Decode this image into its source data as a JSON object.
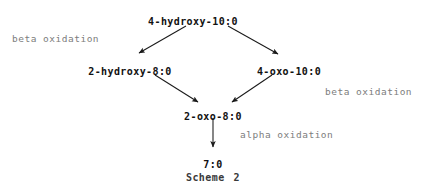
{
  "scheme": {
    "caption_label": "Scheme",
    "caption_number": "2",
    "nodes": [
      {
        "id": "n1",
        "label": "4-hydroxy-10:0",
        "x": 193,
        "y": 16
      },
      {
        "id": "n2",
        "label": "2-hydroxy-8:0",
        "x": 130,
        "y": 66
      },
      {
        "id": "n3",
        "label": "4-oxo-10:0",
        "x": 289,
        "y": 66
      },
      {
        "id": "n4",
        "label": "2-oxo-8:0",
        "x": 213,
        "y": 111
      },
      {
        "id": "n5",
        "label": "7:0",
        "x": 213,
        "y": 159
      }
    ],
    "annotations": [
      {
        "id": "a1",
        "text": "beta oxidation",
        "x": 12,
        "y": 33
      },
      {
        "id": "a2",
        "text": "beta oxidation",
        "x": 325,
        "y": 86
      },
      {
        "id": "a3",
        "text": "alpha oxidation",
        "x": 240,
        "y": 129
      }
    ],
    "edges": [
      {
        "id": "e1",
        "from": "4-hydroxy-10:0",
        "to": "2-hydroxy-8:0",
        "x1": 186,
        "y1": 26,
        "x2": 139,
        "y2": 53
      },
      {
        "id": "e2",
        "from": "4-hydroxy-10:0",
        "to": "4-oxo-10:0",
        "x1": 228,
        "y1": 26,
        "x2": 278,
        "y2": 54
      },
      {
        "id": "e3",
        "from": "2-hydroxy-8:0",
        "to": "2-oxo-8:0",
        "x1": 155,
        "y1": 75,
        "x2": 198,
        "y2": 102
      },
      {
        "id": "e4",
        "from": "4-oxo-10:0",
        "to": "2-oxo-8:0",
        "x1": 272,
        "y1": 75,
        "x2": 232,
        "y2": 102
      },
      {
        "id": "e5",
        "from": "2-oxo-8:0",
        "to": "7:0",
        "x1": 213,
        "y1": 118,
        "x2": 213,
        "y2": 147
      }
    ],
    "caption_x": 213,
    "caption_y": 172,
    "colors": {
      "node_text": "#111111",
      "annotation_text": "#7d7d7d",
      "arrow": "#1a1a1a",
      "background": "#ffffff"
    }
  }
}
